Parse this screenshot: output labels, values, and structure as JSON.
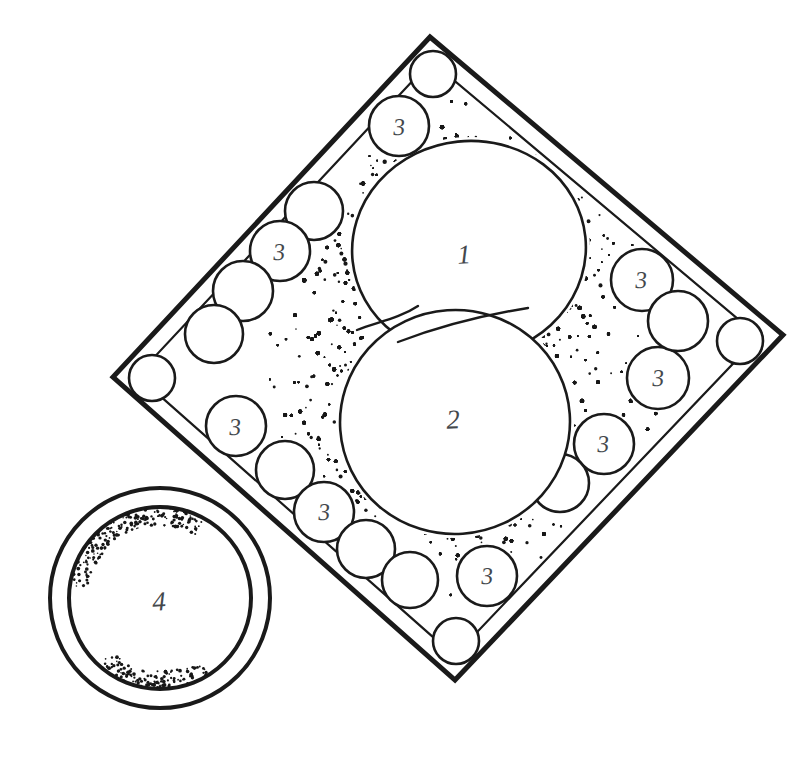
{
  "figure": {
    "style": "hand-drawn technical line drawing, stippled shading",
    "canvas": {
      "width": 811,
      "height": 764,
      "background": "#ffffff"
    },
    "colors": {
      "ink": "#1a1a1a",
      "label_ink": "#44484d",
      "stipple": "#171717",
      "fill": "#ffffff"
    }
  },
  "frame": {
    "name": "diamond-frame",
    "shape": "square rotated 45 degrees (diamond)",
    "double_line": true,
    "outer_stroke_width": 5,
    "inner_stroke_width": 2.2,
    "inner_offset_px": 17,
    "vertices": {
      "top": {
        "x": 430,
        "y": 37
      },
      "right": {
        "x": 783,
        "y": 335
      },
      "bottom": {
        "x": 455,
        "y": 680
      },
      "left": {
        "x": 113,
        "y": 377
      }
    }
  },
  "reference_labels": [
    {
      "id": "label-1",
      "text": "1",
      "size": "major",
      "x": 464,
      "y": 255
    },
    {
      "id": "label-2",
      "text": "2",
      "size": "major",
      "x": 453,
      "y": 420
    },
    {
      "id": "label-4",
      "text": "4",
      "size": "major",
      "x": 159,
      "y": 602
    },
    {
      "id": "label-3-top",
      "text": "3",
      "size": "minor",
      "x": 399,
      "y": 127
    },
    {
      "id": "label-3-upper-left",
      "text": "3",
      "size": "minor",
      "x": 279,
      "y": 252
    },
    {
      "id": "label-3-lower-left",
      "text": "3",
      "size": "minor",
      "x": 235,
      "y": 427
    },
    {
      "id": "label-3-bottom-left",
      "text": "3",
      "size": "minor",
      "x": 324,
      "y": 512
    },
    {
      "id": "label-3-bottom",
      "text": "3",
      "size": "minor",
      "x": 487,
      "y": 576
    },
    {
      "id": "label-3-upper-right",
      "text": "3",
      "size": "minor",
      "x": 641,
      "y": 280
    },
    {
      "id": "label-3-right",
      "text": "3",
      "size": "minor",
      "x": 658,
      "y": 378
    },
    {
      "id": "label-3-lower-right",
      "text": "3",
      "size": "minor",
      "x": 603,
      "y": 444
    }
  ],
  "primary_bodies": [
    {
      "id": "body-1",
      "ref": "1",
      "description": "upper large circular body",
      "cx": 469,
      "cy": 249,
      "rx": 117,
      "ry": 108,
      "rotation": -6
    },
    {
      "id": "body-2",
      "ref": "2",
      "description": "lower large circular body, overlaps body 1",
      "cx": 455,
      "cy": 422,
      "rx": 115,
      "ry": 112,
      "rotation": -4
    }
  ],
  "overlap_arcs": [
    {
      "id": "overlap-arc-left",
      "d": "M 357 330 C 378 322 400 318 418 306"
    },
    {
      "id": "overlap-arc-right",
      "d": "M 398 342 C 440 326 490 314 528 308"
    }
  ],
  "corner_circles": [
    {
      "id": "corner-circle-top",
      "cx": 433,
      "cy": 74,
      "r": 23
    },
    {
      "id": "corner-circle-right",
      "cx": 740,
      "cy": 341,
      "r": 23
    },
    {
      "id": "corner-circle-bottom",
      "cx": 456,
      "cy": 641,
      "r": 23
    },
    {
      "id": "corner-circle-left",
      "cx": 152,
      "cy": 378,
      "r": 23
    }
  ],
  "satellite_circles": [
    {
      "id": "sat-top-1",
      "cx": 399,
      "cy": 126,
      "r": 30,
      "labeled": true
    },
    {
      "id": "sat-ul-1",
      "cx": 314,
      "cy": 211,
      "r": 29,
      "labeled": false
    },
    {
      "id": "sat-ul-2",
      "cx": 280,
      "cy": 251,
      "r": 30,
      "labeled": true
    },
    {
      "id": "sat-ul-3",
      "cx": 243,
      "cy": 291,
      "r": 30,
      "labeled": false
    },
    {
      "id": "sat-ul-4",
      "cx": 214,
      "cy": 334,
      "r": 29,
      "labeled": false
    },
    {
      "id": "sat-ll-1",
      "cx": 236,
      "cy": 426,
      "r": 30,
      "labeled": true
    },
    {
      "id": "sat-ll-2",
      "cx": 285,
      "cy": 470,
      "r": 29,
      "labeled": false
    },
    {
      "id": "sat-ll-3",
      "cx": 324,
      "cy": 512,
      "r": 30,
      "labeled": true
    },
    {
      "id": "sat-ll-4",
      "cx": 366,
      "cy": 549,
      "r": 29,
      "labeled": false
    },
    {
      "id": "sat-ll-5",
      "cx": 410,
      "cy": 580,
      "r": 28,
      "labeled": false
    },
    {
      "id": "sat-bot-1",
      "cx": 487,
      "cy": 576,
      "r": 30,
      "labeled": true
    },
    {
      "id": "sat-lr-1",
      "cx": 604,
      "cy": 444,
      "r": 30,
      "labeled": true
    },
    {
      "id": "sat-lr-2",
      "cx": 560,
      "cy": 483,
      "r": 29,
      "labeled": false
    },
    {
      "id": "sat-r-1",
      "cx": 658,
      "cy": 378,
      "r": 31,
      "labeled": true
    },
    {
      "id": "sat-ur-1",
      "cx": 642,
      "cy": 280,
      "r": 31,
      "labeled": true
    },
    {
      "id": "sat-ur-2",
      "cx": 678,
      "cy": 321,
      "r": 30,
      "labeled": false
    }
  ],
  "ring_body": {
    "id": "body-4",
    "ref": "4",
    "description": "detached annular ring, outer and inner circle",
    "cx": 160,
    "cy": 598,
    "outer_r": 110,
    "inner_r": 91,
    "stroke_width": 4
  },
  "stipple": {
    "description": "irregular ink dot shading filling the frame border zone between the diamond and the two large bodies, and a light arc of dots inside ring 4",
    "dot_radius_range": [
      0.7,
      2.2
    ],
    "density": "dense at body edges, sparse toward open areas"
  }
}
